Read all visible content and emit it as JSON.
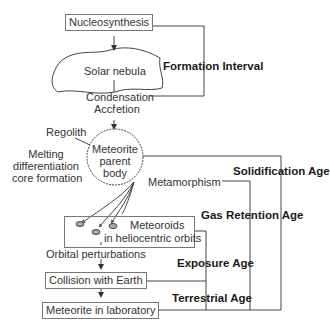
{
  "diagram": {
    "nodes": {
      "nucleosynthesis": "Nucleosynthesis",
      "solar_nebula": "Solar nebula",
      "condensation": "Condensation",
      "accretion": "Accretion",
      "regolith": "Regolith",
      "melting_1": "Melting",
      "melting_2": "differentiation",
      "melting_3": "core formation",
      "parent_body_1": "Meteorite",
      "parent_body_2": "parent",
      "parent_body_3": "body",
      "metamorphism": "Metamorphism",
      "meteoroids_1": "Meteoroids",
      "meteoroids_2": "in heliocentric orbits",
      "orbital": "Orbital perturbations",
      "collision": "Collision with Earth",
      "laboratory": "Meteorite in laboratory"
    },
    "intervals": {
      "formation": "Formation Interval",
      "solidification": "Solidification Age",
      "gas_retention": "Gas Retention Age",
      "exposure": "Exposure Age",
      "terrestrial": "Terrestrial Age"
    },
    "colors": {
      "line": "#444444",
      "text": "#333333"
    }
  }
}
